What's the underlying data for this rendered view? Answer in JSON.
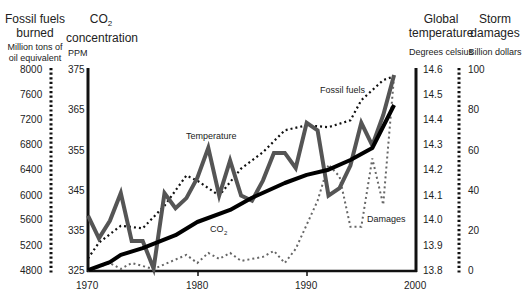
{
  "axes": {
    "fossil": {
      "title_line1": "Fossil fuels",
      "title_line2": "burned",
      "unit_line1": "Million tons of",
      "unit_line2": "oil equivalent",
      "ticks": [
        "8000",
        "7600",
        "7200",
        "6800",
        "6400",
        "6000",
        "5600",
        "5200",
        "4800"
      ]
    },
    "co2": {
      "title_line1": "CO",
      "title_sub": "2",
      "title_line2": "concentration",
      "unit": "PPM",
      "ticks": [
        "375",
        "365",
        "355",
        "345",
        "335",
        "325"
      ]
    },
    "temp": {
      "title_line1": "Global",
      "title_line2": "temperature",
      "unit": "Degrees celsius",
      "ticks": [
        "14.6",
        "14.5",
        "14.4",
        "14.3",
        "14.2",
        "14.1",
        "14.0",
        "13.9",
        "13.8"
      ]
    },
    "storm": {
      "title_line1": "Storm",
      "title_line2": "damages",
      "unit": "Billion dollars",
      "ticks": [
        "100",
        "80",
        "60",
        "40",
        "20",
        "0"
      ]
    },
    "x": {
      "ticks": [
        "1970",
        "1980",
        "1990",
        "2000"
      ]
    }
  },
  "annotations": {
    "temperature": "Temperature",
    "fossil_fuels": "Fossil fuels",
    "co2": "CO",
    "co2_sub": "2",
    "damages": "Damages"
  },
  "chart_data": {
    "type": "line",
    "title": "",
    "xlabel": "",
    "x_range": [
      1970,
      2000
    ],
    "grid": false,
    "legend": "inline annotations",
    "series": [
      {
        "name": "Temperature",
        "axis": "Global temperature (Degrees celsius)",
        "ylim": [
          13.8,
          14.6
        ],
        "style": "thick gray solid",
        "x": [
          1970,
          1971,
          1972,
          1973,
          1974,
          1975,
          1976,
          1977,
          1978,
          1979,
          1980,
          1981,
          1982,
          1983,
          1984,
          1985,
          1986,
          1987,
          1988,
          1989,
          1990,
          1991,
          1992,
          1993,
          1994,
          1995,
          1996,
          1997,
          1998
        ],
        "values": [
          14.02,
          13.93,
          14.0,
          14.11,
          13.92,
          13.92,
          13.81,
          14.11,
          14.05,
          14.09,
          14.17,
          14.29,
          14.1,
          14.24,
          14.1,
          14.08,
          14.16,
          14.27,
          14.27,
          14.21,
          14.39,
          14.36,
          14.1,
          14.13,
          14.22,
          14.39,
          14.3,
          14.42,
          14.58
        ]
      },
      {
        "name": "CO2",
        "axis": "CO2 concentration (PPM)",
        "ylim": [
          325,
          375
        ],
        "style": "thick black solid",
        "x": [
          1970,
          1972,
          1973,
          1975,
          1978,
          1980,
          1983,
          1985,
          1988,
          1990,
          1992,
          1994,
          1996,
          1998
        ],
        "values": [
          325.2,
          327.2,
          329.0,
          330.7,
          333.9,
          337.2,
          340.2,
          343.2,
          346.9,
          348.9,
          350.2,
          352.6,
          355.6,
          366.3
        ]
      },
      {
        "name": "Fossil fuels",
        "axis": "Fossil fuels burned (Million tons of oil equivalent)",
        "ylim": [
          4800,
          8000
        ],
        "style": "black dotted",
        "x": [
          1970,
          1971,
          1973,
          1975,
          1977,
          1979,
          1980,
          1982,
          1984,
          1986,
          1988,
          1990,
          1992,
          1994,
          1995,
          1997,
          1998
        ],
        "values": [
          5000,
          5250,
          5520,
          5480,
          5840,
          6320,
          6240,
          6000,
          6430,
          6690,
          7040,
          7120,
          7090,
          7200,
          7520,
          7840,
          7900
        ]
      },
      {
        "name": "Damages",
        "axis": "Storm damages (Billion dollars)",
        "ylim": [
          0,
          100
        ],
        "style": "gray dotted",
        "x": [
          1970,
          1972,
          1973,
          1974,
          1976,
          1979,
          1980,
          1981,
          1982,
          1983,
          1984,
          1986,
          1987,
          1988,
          1989,
          1991,
          1992,
          1993,
          1994,
          1995,
          1996,
          1997,
          1998
        ],
        "values": [
          0,
          4,
          1,
          4,
          1,
          8,
          4,
          9,
          6,
          9,
          5,
          7,
          10,
          4,
          11,
          35,
          53,
          47,
          22,
          22,
          56,
          33,
          97
        ]
      }
    ]
  }
}
